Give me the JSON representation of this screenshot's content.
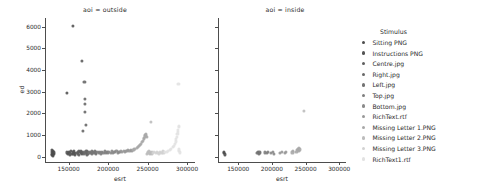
{
  "chart_data": {
    "type": "scatter",
    "title": "",
    "xlabel": "esrt",
    "ylabel": "ed",
    "xlim": [
      120000,
      310000
    ],
    "ylim": [
      -250,
      6400
    ],
    "xticks": [
      150000,
      200000,
      250000,
      300000
    ],
    "xtick_labels": [
      "150000",
      "200000",
      "250000",
      "300000"
    ],
    "yticks": [
      0,
      1000,
      2000,
      3000,
      4000,
      5000,
      6000
    ],
    "ytick_labels": [
      "0",
      "1000",
      "2000",
      "3000",
      "4000",
      "5000",
      "6000"
    ],
    "grid": false,
    "legend_position": "right",
    "legend_title": "Stimulus",
    "facet_variable": "aoi",
    "facets": [
      {
        "label": "aoi = outside",
        "value": "outside"
      },
      {
        "label": "aoi = inside",
        "value": "inside"
      }
    ],
    "series": [
      {
        "name": "Sitting PNG",
        "color": "#4c4c4c"
      },
      {
        "name": "Instructions PNG",
        "color": "#545454"
      },
      {
        "name": "Centre.jpg",
        "color": "#5e5e5e"
      },
      {
        "name": "Right.jpg",
        "color": "#686868"
      },
      {
        "name": "Left.jpg",
        "color": "#737373"
      },
      {
        "name": "Top.jpg",
        "color": "#7e7e7e"
      },
      {
        "name": "Bottom.jpg",
        "color": "#8a8a8a"
      },
      {
        "name": "RichText.rtf",
        "color": "#989898"
      },
      {
        "name": "Missing Letter 1.PNG",
        "color": "#a8a8a8"
      },
      {
        "name": "Missing Letter 2.PNG",
        "color": "#bcbcbc"
      },
      {
        "name": "Missing Letter 3.PNG",
        "color": "#d2d2d2"
      },
      {
        "name": "RichText1.rtf",
        "color": "#e2e2e2"
      }
    ],
    "points_outside": [
      [
        128500,
        120,
        0
      ],
      [
        128800,
        90,
        0
      ],
      [
        129200,
        210,
        0
      ],
      [
        129600,
        160,
        0
      ],
      [
        130000,
        60,
        0
      ],
      [
        130400,
        250,
        0
      ],
      [
        130900,
        130,
        0
      ],
      [
        131300,
        190,
        0
      ],
      [
        129000,
        300,
        0
      ],
      [
        130200,
        40,
        0
      ],
      [
        147500,
        2950,
        1
      ],
      [
        148200,
        190,
        1
      ],
      [
        149000,
        120,
        1
      ],
      [
        150000,
        230,
        1
      ],
      [
        151000,
        160,
        1
      ],
      [
        152000,
        90,
        1
      ],
      [
        153000,
        260,
        1
      ],
      [
        154000,
        140,
        1
      ],
      [
        155000,
        6030,
        1
      ],
      [
        155500,
        200,
        1
      ],
      [
        156000,
        110,
        1
      ],
      [
        156500,
        180,
        1
      ],
      [
        157000,
        240,
        1
      ],
      [
        157500,
        70,
        1
      ],
      [
        158000,
        150,
        1
      ],
      [
        160500,
        170,
        2
      ],
      [
        161200,
        230,
        2
      ],
      [
        162000,
        120,
        2
      ],
      [
        162800,
        280,
        2
      ],
      [
        163500,
        90,
        2
      ],
      [
        164200,
        200,
        2
      ],
      [
        165000,
        150,
        2
      ],
      [
        165800,
        250,
        2
      ],
      [
        166500,
        110,
        2
      ],
      [
        167000,
        4430,
        2
      ],
      [
        167300,
        190,
        2
      ],
      [
        167900,
        160,
        2
      ],
      [
        168500,
        1180,
        3
      ],
      [
        169000,
        220,
        3
      ],
      [
        169500,
        130,
        3
      ],
      [
        170000,
        3430,
        3
      ],
      [
        170400,
        2680,
        3
      ],
      [
        170700,
        2450,
        3
      ],
      [
        171000,
        2080,
        3
      ],
      [
        171400,
        1480,
        3
      ],
      [
        171800,
        240,
        3
      ],
      [
        172200,
        170,
        3
      ],
      [
        172600,
        100,
        3
      ],
      [
        173000,
        200,
        3
      ],
      [
        173400,
        260,
        3
      ],
      [
        173800,
        140,
        3
      ],
      [
        174200,
        190,
        3
      ],
      [
        176000,
        180,
        4
      ],
      [
        177000,
        220,
        4
      ],
      [
        178000,
        150,
        4
      ],
      [
        179000,
        260,
        4
      ],
      [
        180000,
        130,
        4
      ],
      [
        181000,
        200,
        4
      ],
      [
        182000,
        170,
        4
      ],
      [
        183000,
        240,
        4
      ],
      [
        184000,
        110,
        4
      ],
      [
        185000,
        190,
        4
      ],
      [
        186500,
        200,
        5
      ],
      [
        188000,
        160,
        5
      ],
      [
        189500,
        230,
        5
      ],
      [
        191000,
        140,
        5
      ],
      [
        192500,
        210,
        5
      ],
      [
        194000,
        180,
        5
      ],
      [
        195500,
        250,
        5
      ],
      [
        197000,
        150,
        5
      ],
      [
        198500,
        220,
        5
      ],
      [
        200000,
        190,
        5
      ],
      [
        201500,
        210,
        6
      ],
      [
        203000,
        180,
        6
      ],
      [
        204500,
        240,
        6
      ],
      [
        206000,
        160,
        6
      ],
      [
        207500,
        220,
        6
      ],
      [
        209000,
        200,
        6
      ],
      [
        210500,
        260,
        6
      ],
      [
        212000,
        180,
        6
      ],
      [
        213500,
        230,
        6
      ],
      [
        215000,
        210,
        6
      ],
      [
        216500,
        240,
        7
      ],
      [
        218000,
        220,
        7
      ],
      [
        219500,
        260,
        7
      ],
      [
        221000,
        230,
        7
      ],
      [
        222500,
        270,
        7
      ],
      [
        224000,
        250,
        7
      ],
      [
        225500,
        290,
        7
      ],
      [
        227000,
        260,
        7
      ],
      [
        228500,
        300,
        7
      ],
      [
        230000,
        280,
        7
      ],
      [
        231500,
        310,
        8
      ],
      [
        233000,
        330,
        8
      ],
      [
        234500,
        360,
        8
      ],
      [
        236000,
        390,
        8
      ],
      [
        237500,
        430,
        8
      ],
      [
        239000,
        480,
        8
      ],
      [
        240500,
        540,
        8
      ],
      [
        241800,
        600,
        8
      ],
      [
        243000,
        670,
        8
      ],
      [
        244000,
        740,
        8
      ],
      [
        244900,
        800,
        8
      ],
      [
        245600,
        870,
        8
      ],
      [
        246200,
        930,
        8
      ],
      [
        246800,
        990,
        8
      ],
      [
        247300,
        1040,
        8
      ],
      [
        247800,
        1010,
        8
      ],
      [
        248200,
        960,
        8
      ],
      [
        248600,
        900,
        8
      ],
      [
        249500,
        120,
        9
      ],
      [
        250200,
        200,
        9
      ],
      [
        251000,
        160,
        9
      ],
      [
        251800,
        240,
        9
      ],
      [
        252500,
        110,
        9
      ],
      [
        253200,
        190,
        9
      ],
      [
        254000,
        1620,
        9
      ],
      [
        254600,
        150,
        9
      ],
      [
        255200,
        220,
        9
      ],
      [
        255800,
        130,
        9
      ],
      [
        257000,
        170,
        10
      ],
      [
        258500,
        210,
        10
      ],
      [
        260000,
        150,
        10
      ],
      [
        261500,
        230,
        10
      ],
      [
        263000,
        180,
        10
      ],
      [
        264500,
        120,
        10
      ],
      [
        266000,
        200,
        10
      ],
      [
        267500,
        160,
        10
      ],
      [
        269000,
        240,
        10
      ],
      [
        270000,
        190,
        10
      ],
      [
        272000,
        200,
        11
      ],
      [
        274000,
        230,
        11
      ],
      [
        276000,
        270,
        11
      ],
      [
        278000,
        310,
        11
      ],
      [
        280000,
        370,
        11
      ],
      [
        281500,
        430,
        11
      ],
      [
        283000,
        510,
        11
      ],
      [
        284300,
        600,
        11
      ],
      [
        285400,
        700,
        11
      ],
      [
        286300,
        810,
        11
      ],
      [
        287100,
        920,
        11
      ],
      [
        287800,
        1030,
        11
      ],
      [
        288400,
        1140,
        11
      ],
      [
        288900,
        1250,
        11
      ],
      [
        289300,
        1350,
        11
      ],
      [
        289700,
        1420,
        11
      ],
      [
        289000,
        3370,
        11
      ],
      [
        290200,
        260,
        11
      ],
      [
        290600,
        190,
        11
      ],
      [
        290000,
        330,
        11
      ]
    ],
    "points_inside": [
      [
        128800,
        150,
        0
      ],
      [
        129400,
        210,
        0
      ],
      [
        130000,
        100,
        0
      ],
      [
        178500,
        180,
        4
      ],
      [
        179500,
        230,
        4
      ],
      [
        180500,
        140,
        4
      ],
      [
        181500,
        200,
        4
      ],
      [
        182500,
        160,
        4
      ],
      [
        190000,
        190,
        5
      ],
      [
        192000,
        150,
        5
      ],
      [
        194500,
        220,
        5
      ],
      [
        199000,
        170,
        6
      ],
      [
        201000,
        210,
        6
      ],
      [
        203000,
        140,
        6
      ],
      [
        212000,
        180,
        7
      ],
      [
        214500,
        220,
        7
      ],
      [
        219500,
        160,
        7
      ],
      [
        221500,
        200,
        7
      ],
      [
        230500,
        190,
        8
      ],
      [
        231500,
        240,
        8
      ],
      [
        236500,
        230,
        8
      ],
      [
        237500,
        290,
        8
      ],
      [
        238500,
        350,
        8
      ],
      [
        239200,
        300,
        8
      ],
      [
        239800,
        250,
        8
      ],
      [
        240400,
        380,
        8
      ],
      [
        241000,
        330,
        8
      ],
      [
        248000,
        2100,
        9
      ]
    ]
  }
}
